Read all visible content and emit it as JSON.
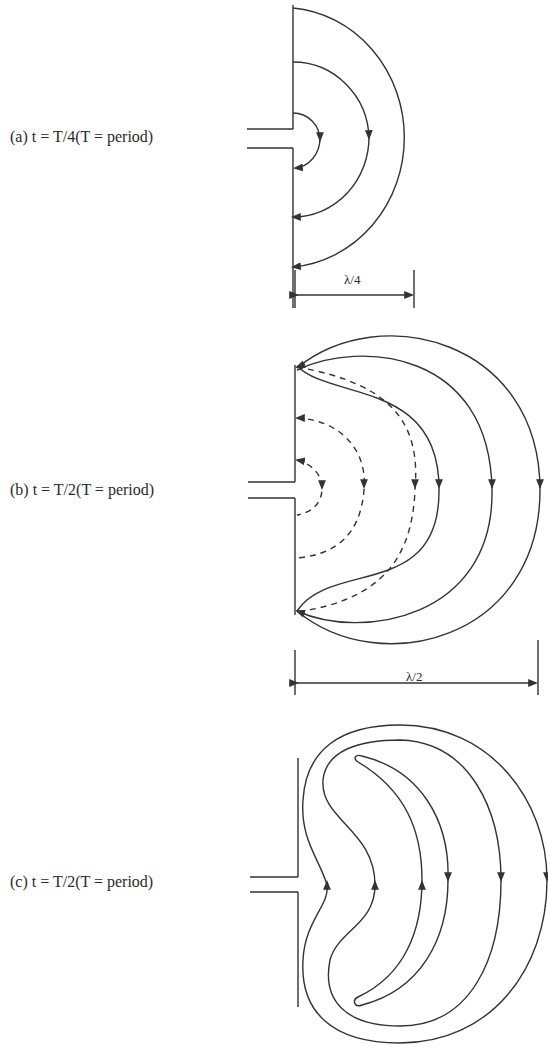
{
  "figure": {
    "panels": [
      {
        "id": "a",
        "label": "(a) t = T/4(T = period)",
        "dimension": "λ/4",
        "field_lines": {
          "solid": 3,
          "dashed": 0
        }
      },
      {
        "id": "b",
        "label": "(b) t = T/2(T = period)",
        "dimension": "λ/2",
        "field_lines": {
          "solid": 3,
          "dashed": 3
        }
      },
      {
        "id": "c",
        "label": "(c) t = T/2(T = period)",
        "dimension": "",
        "field_lines": {
          "closed_loops": 3
        }
      }
    ],
    "colors": {
      "line": "#333333",
      "background": "#ffffff"
    }
  }
}
